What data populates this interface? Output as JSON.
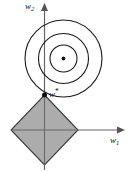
{
  "figure": {
    "background_color": "#ffffff",
    "width": 133,
    "height": 172
  },
  "axes": {
    "horizontal": {
      "name": "w1-axis",
      "label": "w",
      "subscript": "1",
      "arrow": "right",
      "y": 130,
      "x_start": 11,
      "x_end": 124,
      "color": "#555555"
    },
    "vertical": {
      "name": "w2-axis",
      "label": "w",
      "subscript": "2",
      "arrow": "up",
      "x": 44,
      "y_start": 170,
      "y_end": 6,
      "color": "#555555"
    }
  },
  "contours": {
    "name": "loss-contours",
    "center_x": 63.5,
    "center_y": 58.5,
    "stroke_color": "#1a1a1a",
    "fill": "none",
    "radii": [
      13.5,
      25,
      38.5
    ],
    "center_dot": {
      "name": "contour-center-dot",
      "radius": 1.8,
      "color": "#111111"
    }
  },
  "constraint_region": {
    "name": "l1-diamond",
    "shape": "diamond",
    "fill_color": "#a8a8a8",
    "stroke_color": "#333333",
    "center_x": 44.5,
    "center_y": 130,
    "half_width": 33.5,
    "half_height": 35
  },
  "solution_point": {
    "name": "optimum-w-star",
    "label": "w",
    "star": "*",
    "x": 44.5,
    "y": 95,
    "radius": 2.4,
    "color": "#111111"
  },
  "labels": {
    "w1": {
      "text": "w",
      "sub": "1"
    },
    "w2": {
      "text": "w",
      "sub": "2"
    },
    "w_star": {
      "text": "w",
      "star": "*"
    }
  }
}
